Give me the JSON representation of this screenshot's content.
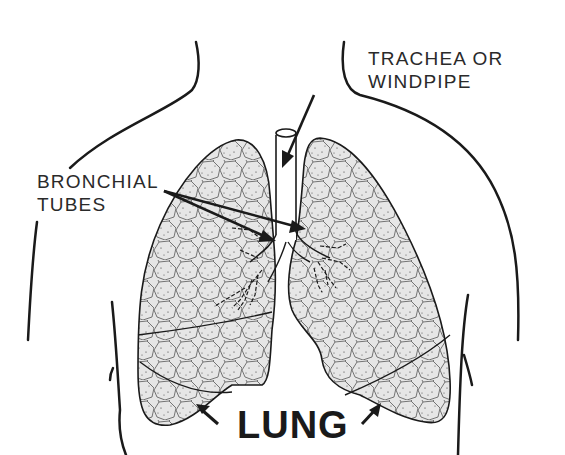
{
  "diagram": {
    "title": "LUNG",
    "labels": {
      "trachea_line1": "TRACHEA OR",
      "trachea_line2": "WINDPIPE",
      "bronchial_line1": "BRONCHIAL",
      "bronchial_line2": "TUBES"
    },
    "colors": {
      "ink": "#1a1a1a",
      "lung_fill": "#e4e4e4",
      "background": "#ffffff"
    }
  }
}
